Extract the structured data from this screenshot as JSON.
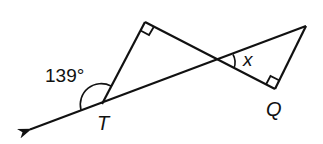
{
  "diagram": {
    "type": "geometry",
    "colors": {
      "line": "#111111",
      "background": "#ffffff"
    },
    "labels": {
      "angle_exterior": "139°",
      "vertex_T": "T",
      "vertex_Q": "Q",
      "angle_x": "x"
    },
    "points": {
      "arrow_tip": [
        28,
        130
      ],
      "T": [
        102,
        104
      ],
      "top_right_angle": [
        145,
        22
      ],
      "intersection": [
        218,
        60
      ],
      "right_vertex": [
        306,
        26
      ],
      "Q": [
        275,
        89
      ]
    },
    "right_angles": [
      "top_right_angle",
      "Q"
    ],
    "given": {
      "exterior_angle_at_T_deg": 139
    },
    "unknown": "x"
  }
}
